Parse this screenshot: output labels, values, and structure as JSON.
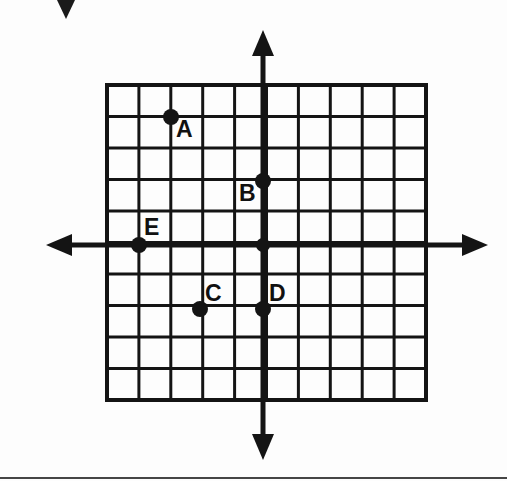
{
  "figure": {
    "background_color": "#fdfdfd",
    "ink_color": "#141414",
    "grid": {
      "columns": 10,
      "rows": 10,
      "cell_size_px": 31.9,
      "left_px": 107,
      "top_px": 85,
      "right_px": 426,
      "bottom_px": 400,
      "line_color": "#141414",
      "line_width_px": 3,
      "border_width_px": 4
    },
    "axes": {
      "origin_px": {
        "x": 263,
        "y": 245
      },
      "x_axis": {
        "name": "horizontal-axis",
        "from_px": 46,
        "to_px": 488,
        "y_px": 245,
        "arrow_left": true,
        "arrow_right": true,
        "line_width_px": 5
      },
      "y_axis": {
        "name": "vertical-axis",
        "from_px": 30,
        "to_px": 460,
        "x_px": 263,
        "arrow_up": true,
        "arrow_down": true,
        "line_width_px": 5
      }
    },
    "artifacts": {
      "scan_triangle": {
        "left_px": 57,
        "top_px": 0,
        "width_px": 18,
        "height_px": 19
      },
      "bottom_rule": {
        "top_px": 477,
        "height_px": 2
      }
    }
  },
  "chart_data": {
    "type": "scatter",
    "title": "",
    "xlabel": "",
    "ylabel": "",
    "xlim": [
      -5,
      5
    ],
    "ylim": [
      -5,
      5
    ],
    "grid": true,
    "gridlines_every": 1,
    "legend": "none",
    "axis_tick_labels": [],
    "points": [
      {
        "label": "A",
        "x": -3,
        "y": 4,
        "px": 171,
        "py": 117,
        "label_px": 176,
        "label_py": 118,
        "dot_radius_px": 8
      },
      {
        "label": "B",
        "x": 0,
        "y": 2,
        "px": 263,
        "py": 181,
        "label_px": 239,
        "label_py": 182,
        "dot_radius_px": 8
      },
      {
        "label": "C",
        "x": -2,
        "y": -2,
        "px": 200,
        "py": 309,
        "label_px": 205,
        "label_py": 282,
        "dot_radius_px": 8
      },
      {
        "label": "D",
        "x": 0,
        "y": -2,
        "px": 263,
        "py": 309,
        "label_px": 269,
        "label_py": 282,
        "dot_radius_px": 8
      },
      {
        "label": "E",
        "x": -4,
        "y": 0,
        "px": 139,
        "py": 245,
        "label_px": 144,
        "label_py": 216,
        "dot_radius_px": 8
      }
    ],
    "origin_point": {
      "label": "",
      "x": 0,
      "y": 0,
      "px": 263,
      "py": 245,
      "dot_radius_px": 7
    }
  }
}
